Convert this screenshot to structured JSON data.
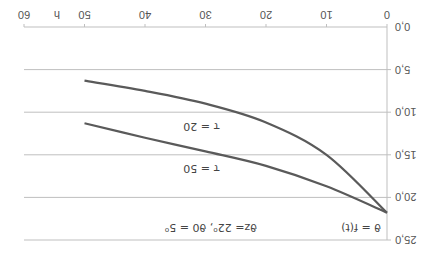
{
  "chart_data": {
    "type": "line",
    "title": "",
    "xlabel": "h",
    "ylabel": "",
    "x_ticks": [
      "0",
      "10",
      "20",
      "30",
      "40",
      "50",
      "60"
    ],
    "y_ticks": [
      "0,0",
      "5,0",
      "10,0",
      "15,0",
      "20,0",
      "25,0"
    ],
    "xlim": [
      0,
      60
    ],
    "ylim": [
      0,
      25
    ],
    "y_inverted": true,
    "grid": "horizontal",
    "orientation_note": "image rotated 180 degrees",
    "annotations": {
      "function_label": "ϑ = f(t)",
      "params_label": "ϑz= 22⁰, ϑ0 = 5⁰",
      "tau20_label": "τ = 20",
      "tau50_label": "τ = 50"
    },
    "x": [
      0,
      10,
      20,
      30,
      40,
      50
    ],
    "series": [
      {
        "name": "τ = 20",
        "values": [
          21.8,
          15.0,
          11.2,
          9.0,
          7.5,
          6.3
        ]
      },
      {
        "name": "τ = 50",
        "values": [
          21.8,
          18.7,
          16.3,
          14.6,
          13.0,
          11.3
        ]
      }
    ]
  },
  "colors": {
    "curve": "#5a5a5a",
    "grid": "#bfbfbf",
    "text": "#555555"
  }
}
